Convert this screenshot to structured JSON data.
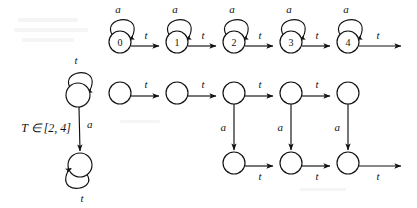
{
  "figure": {
    "background_color": "#ffffff",
    "ink_color": "#111111",
    "width": 417,
    "height": 208
  },
  "guard": {
    "text": "T ∈ [2, 4]"
  },
  "symbols": {
    "a": "a",
    "t": "t"
  },
  "left_automaton": {
    "name": "guarded-two-state-automaton",
    "states": [
      {
        "id": "L0",
        "label": "",
        "cx": 78,
        "cy": 95,
        "r": 12
      },
      {
        "id": "L1",
        "label": "",
        "cx": 80,
        "cy": 165,
        "r": 12
      }
    ],
    "self_loops": [
      {
        "from": "L0",
        "symbol": "t",
        "position": "top"
      },
      {
        "from": "L1",
        "symbol": "t",
        "position": "bottom"
      }
    ],
    "transitions": [
      {
        "from": "L0",
        "to": "L1",
        "symbol": "a",
        "guard": "T ∈ [2, 4]"
      }
    ]
  },
  "top_chain": {
    "name": "integer-clock-chain",
    "states": [
      {
        "id": "0",
        "label": "0",
        "cx": 120,
        "cy": 42,
        "r": 11
      },
      {
        "id": "1",
        "label": "1",
        "cx": 177,
        "cy": 42,
        "r": 11
      },
      {
        "id": "2",
        "label": "2",
        "cx": 234,
        "cy": 42,
        "r": 11
      },
      {
        "id": "3",
        "label": "3",
        "cx": 291,
        "cy": 42,
        "r": 11
      },
      {
        "id": "4",
        "label": "4",
        "cx": 348,
        "cy": 42,
        "r": 11
      }
    ],
    "self_loop_symbol": "a",
    "transition_symbol": "t",
    "transitions": [
      {
        "from": "0",
        "to": "1",
        "symbol": "t"
      },
      {
        "from": "1",
        "to": "2",
        "symbol": "t"
      },
      {
        "from": "2",
        "to": "3",
        "symbol": "t"
      },
      {
        "from": "3",
        "to": "4",
        "symbol": "t"
      },
      {
        "from": "4",
        "to": "open",
        "symbol": "t"
      }
    ]
  },
  "bottom_grid": {
    "name": "unfolded-region-grid",
    "top_row": [
      {
        "id": "U0",
        "label": "",
        "cx": 120,
        "cy": 93,
        "r": 11
      },
      {
        "id": "U1",
        "label": "",
        "cx": 177,
        "cy": 93,
        "r": 11
      },
      {
        "id": "U2",
        "label": "",
        "cx": 234,
        "cy": 93,
        "r": 11
      },
      {
        "id": "U3",
        "label": "",
        "cx": 291,
        "cy": 93,
        "r": 11
      },
      {
        "id": "U4",
        "label": "",
        "cx": 348,
        "cy": 93,
        "r": 11
      }
    ],
    "bottom_row": [
      {
        "id": "D2",
        "label": "",
        "cx": 234,
        "cy": 163,
        "r": 11
      },
      {
        "id": "D3",
        "label": "",
        "cx": 291,
        "cy": 163,
        "r": 11
      },
      {
        "id": "D4",
        "label": "",
        "cx": 348,
        "cy": 163,
        "r": 11
      }
    ],
    "horizontal_symbol": "t",
    "vertical_symbol": "a",
    "top_transitions": [
      {
        "from": "U0",
        "to": "U1",
        "symbol": "t"
      },
      {
        "from": "U1",
        "to": "U2",
        "symbol": "t"
      },
      {
        "from": "U2",
        "to": "U3",
        "symbol": "t"
      },
      {
        "from": "U3",
        "to": "U4",
        "symbol": "t"
      }
    ],
    "vertical_transitions": [
      {
        "from": "U2",
        "to": "D2",
        "symbol": "a"
      },
      {
        "from": "U3",
        "to": "D3",
        "symbol": "a"
      },
      {
        "from": "U4",
        "to": "D4",
        "symbol": "a"
      }
    ],
    "bottom_transitions": [
      {
        "from": "D2",
        "to": "D3",
        "symbol": "t"
      },
      {
        "from": "D3",
        "to": "D4",
        "symbol": "t"
      },
      {
        "from": "D4",
        "to": "open",
        "symbol": "t"
      }
    ]
  }
}
